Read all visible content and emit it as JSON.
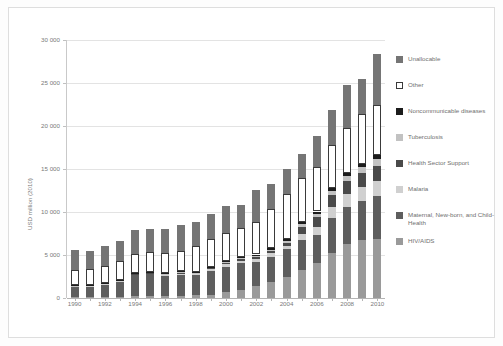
{
  "chart_data": {
    "type": "bar",
    "subtype": "stacked-vertical",
    "title": "",
    "xlabel": "",
    "ylabel": "USD million (2010)",
    "ylim": [
      0,
      30000
    ],
    "yticks": [
      0,
      5000,
      10000,
      15000,
      20000,
      25000,
      30000
    ],
    "ytick_labels": [
      "0",
      "5 000",
      "10 000",
      "15 000",
      "20 000",
      "25 000",
      "30 000"
    ],
    "grid": true,
    "legend_position": "right",
    "categories": [
      1990,
      1991,
      1992,
      1993,
      1994,
      1995,
      1996,
      1997,
      1998,
      1999,
      2000,
      2001,
      2002,
      2003,
      2004,
      2005,
      2006,
      2007,
      2008,
      2009,
      2010
    ],
    "xtick_labels": [
      "1990",
      "1992",
      "1994",
      "1996",
      "1998",
      "2000",
      "2002",
      "2004",
      "2006",
      "2008",
      "2010"
    ],
    "stack_order_bottom_to_top": [
      "HIV/AIDS",
      "Maternal, New-born, and Child-Health",
      "Malaria",
      "Health Sector Support",
      "Tuberculosis",
      "Noncommunicable diseases",
      "Other",
      "Unallocable"
    ],
    "series": [
      {
        "name": "HIV/AIDS",
        "color": "#9a9a9a",
        "values": [
          120,
          130,
          150,
          170,
          200,
          220,
          240,
          280,
          320,
          400,
          700,
          900,
          1400,
          1900,
          2500,
          3200,
          4100,
          5200,
          6300,
          6700,
          6900
        ]
      },
      {
        "name": "Maternal, New-born, and Child-Health",
        "color": "#5e5e5e",
        "values": [
          1200,
          1250,
          1450,
          1750,
          2450,
          2550,
          2350,
          2450,
          2300,
          2750,
          2950,
          3150,
          2800,
          2900,
          3150,
          3500,
          3250,
          4100,
          4300,
          4600,
          5000
        ]
      },
      {
        "name": "Malaria",
        "color": "#d0d0d0",
        "values": [
          60,
          60,
          70,
          80,
          90,
          100,
          110,
          130,
          150,
          200,
          250,
          280,
          320,
          380,
          450,
          700,
          900,
          1250,
          1450,
          1600,
          1750
        ]
      },
      {
        "name": "Health Sector Support",
        "color": "#4a4a4a",
        "values": [
          40,
          40,
          50,
          60,
          70,
          80,
          90,
          100,
          110,
          130,
          180,
          200,
          230,
          260,
          300,
          900,
          1150,
          1400,
          1500,
          1600,
          1700
        ]
      },
      {
        "name": "Tuberculosis",
        "color": "#c2c2c2",
        "values": [
          30,
          30,
          35,
          40,
          45,
          50,
          55,
          60,
          70,
          90,
          120,
          140,
          170,
          200,
          250,
          320,
          400,
          500,
          600,
          700,
          800
        ]
      },
      {
        "name": "Noncommunicable diseases",
        "color": "#1c1c1c",
        "values": [
          40,
          40,
          45,
          50,
          55,
          60,
          65,
          70,
          80,
          90,
          110,
          120,
          140,
          160,
          180,
          220,
          260,
          300,
          350,
          400,
          450
        ]
      },
      {
        "name": "Other",
        "color": "#ffffff",
        "values": [
          1800,
          1850,
          1900,
          2200,
          2250,
          2250,
          2350,
          2350,
          3050,
          3150,
          3250,
          3350,
          3750,
          4600,
          5250,
          5150,
          5150,
          5000,
          5300,
          5800,
          5900
        ]
      },
      {
        "name": "Unallocable",
        "color": "#757575",
        "values": [
          2250,
          2100,
          2400,
          2250,
          2700,
          2750,
          2750,
          3100,
          2800,
          3000,
          3100,
          2700,
          3700,
          2900,
          2950,
          2800,
          3600,
          4100,
          5000,
          4100,
          5900
        ]
      }
    ]
  },
  "legend": {
    "items": [
      {
        "label": "Unallocable",
        "color": "#757575",
        "swatch": "filled"
      },
      {
        "label": "Other",
        "color": "#ffffff",
        "swatch": "outlined"
      },
      {
        "label": "Noncommunicable diseases",
        "color": "#1c1c1c",
        "swatch": "filled"
      },
      {
        "label": "Tuberculosis",
        "color": "#c2c2c2",
        "swatch": "filled"
      },
      {
        "label": "Health Sector Support",
        "color": "#4a4a4a",
        "swatch": "filled"
      },
      {
        "label": "Malaria",
        "color": "#d0d0d0",
        "swatch": "filled"
      },
      {
        "label": "Maternal, New-born, and Child-Health",
        "color": "#5e5e5e",
        "swatch": "filled"
      },
      {
        "label": "HIV/AIDS",
        "color": "#9a9a9a",
        "swatch": "filled"
      }
    ]
  }
}
